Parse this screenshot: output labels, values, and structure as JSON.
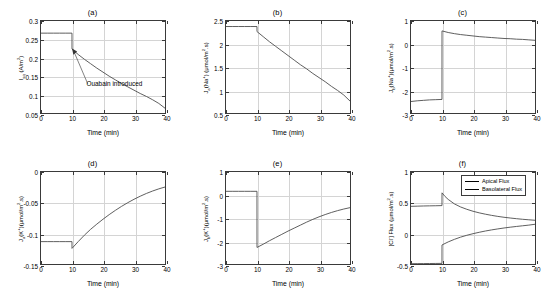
{
  "figure": {
    "width": 555,
    "height": 302,
    "background": "#ffffff",
    "line_color": "#4d4d4d",
    "grid_color": "#d4d4d4",
    "axis_color": "#3a3a3a"
  },
  "panels": [
    {
      "id": "a",
      "title": "(a)",
      "ylabel_html": "I<sub>sq</sub> (A/m<sup>2</sup>)",
      "xlabel": "Time (min)",
      "yticks": [
        "0.05",
        "0.1",
        "0.15",
        "0.2",
        "0.25",
        "0.3"
      ],
      "ytick_vals": [
        0.05,
        0.1,
        0.15,
        0.2,
        0.25,
        0.3
      ],
      "xticks": [
        "0",
        "10",
        "20",
        "30",
        "40"
      ],
      "xtick_vals": [
        0,
        10,
        20,
        30,
        40
      ],
      "annotation": "Ouabain introduced"
    },
    {
      "id": "b",
      "title": "(b)",
      "ylabel_html": "J<sub>a</sub>(Na<sup>+</sup>) (&#956;mol/m<sup>2</sup>.s)",
      "xlabel": "Time (min)",
      "yticks": [
        "0.5",
        "1",
        "1.5",
        "2",
        "2.5"
      ],
      "ytick_vals": [
        0.5,
        1,
        1.5,
        2,
        2.5
      ],
      "xticks": [
        "0",
        "10",
        "20",
        "30",
        "40"
      ],
      "xtick_vals": [
        0,
        10,
        20,
        30,
        40
      ]
    },
    {
      "id": "c",
      "title": "(c)",
      "ylabel_html": "J<sub>b</sub>(Na<sup>+</sup>)(&#956;mol/m<sup>2</sup>.s)",
      "xlabel": "Time (min)",
      "yticks": [
        "-3",
        "-2",
        "-1",
        "0",
        "1"
      ],
      "ytick_vals": [
        -3,
        -2,
        -1,
        0,
        1
      ],
      "xticks": [
        "0",
        "10",
        "20",
        "30",
        "40"
      ],
      "xtick_vals": [
        0,
        10,
        20,
        30,
        40
      ]
    },
    {
      "id": "d",
      "title": "(d)",
      "ylabel_html": "J<sub>a</sub>(K<sup>+</sup>)(&#956;mol/m<sup>2</sup>.s)",
      "xlabel": "Time (min)",
      "yticks": [
        "-0.15",
        "-0.1",
        "-0.05",
        "0"
      ],
      "ytick_vals": [
        -0.15,
        -0.1,
        -0.05,
        0
      ],
      "xticks": [
        "0",
        "10",
        "20",
        "30",
        "40"
      ],
      "xtick_vals": [
        0,
        10,
        20,
        30,
        40
      ]
    },
    {
      "id": "e",
      "title": "(e)",
      "ylabel_html": "J<sub>b</sub>(K<sup>+</sup>)(&#956;mol/m<sup>2</sup>.s)",
      "xlabel": "Time (min)",
      "yticks": [
        "-3",
        "-2",
        "-1",
        "0",
        "1"
      ],
      "ytick_vals": [
        -3,
        -2,
        -1,
        0,
        1
      ],
      "xticks": [
        "0",
        "10",
        "20",
        "30",
        "40"
      ],
      "xtick_vals": [
        0,
        10,
        20,
        30,
        40
      ]
    },
    {
      "id": "f",
      "title": "(f)",
      "ylabel_html": "[Cl<sup>-</sup>] Flux (&#956;mol/m<sup>2</sup>.s)",
      "xlabel": "Time (min)",
      "yticks": [
        "-0.5",
        "0",
        "0.5",
        "1"
      ],
      "ytick_vals": [
        -0.5,
        0,
        0.5,
        1
      ],
      "xticks": [
        "0",
        "10",
        "20",
        "30",
        "40"
      ],
      "xtick_vals": [
        0,
        10,
        20,
        30,
        40
      ],
      "legend": [
        "Apical Flux",
        "Basolateral Flux"
      ]
    }
  ],
  "chart_data": [
    {
      "type": "line",
      "panel": "a",
      "title": "(a)",
      "xlabel": "Time (min)",
      "ylabel": "I_sq (A/m^2)",
      "xlim": [
        0,
        40
      ],
      "ylim": [
        0.05,
        0.3
      ],
      "grid": true,
      "annotations": [
        {
          "text": "Ouabain introduced",
          "x": 10,
          "y": 0.225,
          "note": "arrow points to discontinuity at t=10 min"
        }
      ],
      "series": [
        {
          "name": "I_sq",
          "x": [
            0,
            2,
            4,
            6,
            8,
            9.99,
            10,
            12,
            14,
            16,
            18,
            20,
            22,
            24,
            26,
            28,
            30,
            32,
            34,
            36,
            38,
            40
          ],
          "y": [
            0.267,
            0.267,
            0.267,
            0.267,
            0.267,
            0.267,
            0.224,
            0.209,
            0.196,
            0.184,
            0.172,
            0.161,
            0.15,
            0.14,
            0.13,
            0.121,
            0.112,
            0.103,
            0.095,
            0.086,
            0.076,
            0.063
          ]
        }
      ]
    },
    {
      "type": "line",
      "panel": "b",
      "title": "(b)",
      "xlabel": "Time (min)",
      "ylabel": "J_a(Na+) (umol/m^2.s)",
      "xlim": [
        0,
        40
      ],
      "ylim": [
        0.5,
        2.5
      ],
      "grid": true,
      "series": [
        {
          "name": "J_a(Na+)",
          "x": [
            0,
            2,
            4,
            6,
            8,
            9.99,
            10,
            12,
            14,
            16,
            18,
            20,
            22,
            24,
            26,
            28,
            30,
            32,
            34,
            36,
            38,
            40
          ],
          "y": [
            2.38,
            2.38,
            2.38,
            2.38,
            2.38,
            2.38,
            2.27,
            2.16,
            2.05,
            1.95,
            1.85,
            1.75,
            1.65,
            1.55,
            1.46,
            1.36,
            1.27,
            1.18,
            1.08,
            0.99,
            0.89,
            0.76
          ]
        }
      ]
    },
    {
      "type": "line",
      "panel": "c",
      "title": "(c)",
      "xlabel": "Time (min)",
      "ylabel": "J_b(Na+) (umol/m^2.s)",
      "xlim": [
        0,
        40
      ],
      "ylim": [
        -3,
        1
      ],
      "grid": true,
      "series": [
        {
          "name": "J_b(Na+)",
          "x": [
            0,
            2,
            4,
            6,
            8,
            9.99,
            10,
            12,
            14,
            16,
            18,
            20,
            22,
            24,
            26,
            28,
            30,
            32,
            34,
            36,
            38,
            40
          ],
          "y": [
            -2.5,
            -2.47,
            -2.45,
            -2.43,
            -2.42,
            -2.41,
            0.57,
            0.5,
            0.45,
            0.41,
            0.38,
            0.35,
            0.32,
            0.3,
            0.28,
            0.26,
            0.24,
            0.23,
            0.21,
            0.2,
            0.18,
            0.16
          ]
        }
      ]
    },
    {
      "type": "line",
      "panel": "d",
      "title": "(d)",
      "xlabel": "Time (min)",
      "ylabel": "J_a(K+) (umol/m^2.s)",
      "xlim": [
        0,
        40
      ],
      "ylim": [
        -0.15,
        0
      ],
      "grid": true,
      "series": [
        {
          "name": "J_a(K+)",
          "x": [
            0,
            2,
            4,
            6,
            8,
            9.99,
            10,
            12,
            14,
            16,
            18,
            20,
            22,
            24,
            26,
            28,
            30,
            32,
            34,
            36,
            38,
            40
          ],
          "y": [
            -0.1135,
            -0.1135,
            -0.1135,
            -0.1135,
            -0.1135,
            -0.1135,
            -0.1245,
            -0.1135,
            -0.103,
            -0.0935,
            -0.085,
            -0.077,
            -0.0695,
            -0.0625,
            -0.056,
            -0.05,
            -0.0445,
            -0.0395,
            -0.035,
            -0.031,
            -0.0275,
            -0.0245
          ]
        }
      ]
    },
    {
      "type": "line",
      "panel": "e",
      "title": "(e)",
      "xlabel": "Time (min)",
      "ylabel": "J_b(K+) (umol/m^2.s)",
      "xlim": [
        0,
        40
      ],
      "ylim": [
        -3,
        1
      ],
      "grid": true,
      "series": [
        {
          "name": "J_b(K+)",
          "x": [
            0,
            2,
            4,
            6,
            8,
            9.99,
            10,
            12,
            14,
            16,
            18,
            20,
            22,
            24,
            26,
            28,
            30,
            32,
            34,
            36,
            38,
            40
          ],
          "y": [
            0.16,
            0.16,
            0.16,
            0.16,
            0.16,
            0.16,
            -2.28,
            -2.14,
            -1.99,
            -1.85,
            -1.71,
            -1.57,
            -1.44,
            -1.31,
            -1.18,
            -1.06,
            -0.95,
            -0.85,
            -0.76,
            -0.68,
            -0.61,
            -0.55
          ]
        }
      ]
    },
    {
      "type": "line",
      "panel": "f",
      "title": "(f)",
      "xlabel": "Time (min)",
      "ylabel": "[Cl-] Flux (umol/m^2.s)",
      "xlim": [
        0,
        40
      ],
      "ylim": [
        -0.5,
        1
      ],
      "grid": true,
      "legend_position": "top-right",
      "series": [
        {
          "name": "Apical Flux",
          "x": [
            0,
            2,
            4,
            6,
            8,
            9.99,
            10,
            11,
            12,
            14,
            16,
            18,
            20,
            22,
            24,
            26,
            28,
            30,
            32,
            34,
            36,
            38,
            40
          ],
          "y": [
            0.44,
            0.443,
            0.446,
            0.448,
            0.45,
            0.452,
            0.66,
            0.6,
            0.553,
            0.48,
            0.43,
            0.392,
            0.36,
            0.334,
            0.312,
            0.293,
            0.276,
            0.262,
            0.25,
            0.239,
            0.229,
            0.221,
            0.213
          ]
        },
        {
          "name": "Basolateral Flux",
          "x": [
            0,
            2,
            4,
            6,
            8,
            9.99,
            10,
            12,
            14,
            16,
            18,
            20,
            22,
            24,
            26,
            28,
            30,
            32,
            34,
            36,
            38,
            40
          ],
          "y": [
            -0.495,
            -0.494,
            -0.493,
            -0.492,
            -0.491,
            -0.49,
            -0.19,
            -0.14,
            -0.098,
            -0.062,
            -0.032,
            -0.006,
            0.017,
            0.038,
            0.056,
            0.072,
            0.087,
            0.1,
            0.112,
            0.123,
            0.134,
            0.148
          ]
        }
      ]
    }
  ]
}
